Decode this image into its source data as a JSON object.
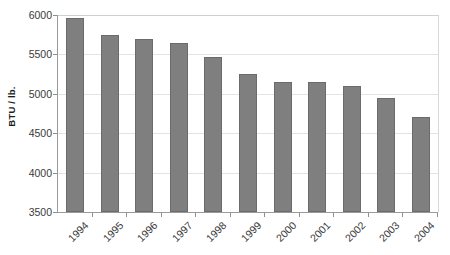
{
  "chart_data": {
    "type": "bar",
    "title": "",
    "xlabel": "",
    "ylabel": "BTU / lb.",
    "categories": [
      "1994",
      "1995",
      "1996",
      "1997",
      "1998",
      "1999",
      "2000",
      "2001",
      "2002",
      "2003",
      "2004"
    ],
    "values": [
      5960,
      5750,
      5700,
      5650,
      5470,
      5250,
      5150,
      5150,
      5100,
      4950,
      4700
    ],
    "series": [
      {
        "name": "BTU / lb.",
        "values": [
          5960,
          5750,
          5700,
          5650,
          5470,
          5250,
          5150,
          5150,
          5100,
          4950,
          4700
        ]
      }
    ],
    "ylim": [
      3500,
      6000
    ],
    "ytick_labels": [
      "6000",
      "5500",
      "5000",
      "4500",
      "4000",
      "3500"
    ],
    "ytick_values": [
      6000,
      5500,
      5000,
      4500,
      4000,
      3500
    ],
    "grid": true,
    "legend": false,
    "legend_position": "none",
    "bar_color": "#7f7f7f",
    "bar_edge_color": "#6b6b6b",
    "gridline_color": "#e3e3e3",
    "axis_color": "#9a9a9a",
    "background_color": "#ffffff",
    "xtick_label_rotation": -45
  },
  "axis": {
    "y_title": "BTU / lb."
  }
}
